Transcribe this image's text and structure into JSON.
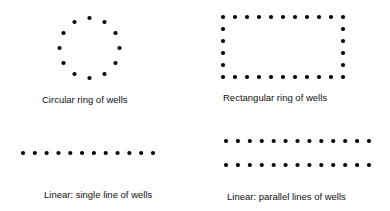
{
  "diagram": {
    "dot_color": "#000000",
    "dot_radius": 2.1,
    "panels": [
      {
        "id": "circular",
        "label": "Circular ring of wells",
        "shape": "circle",
        "well_count": 12,
        "center": [
          89.5,
          48
        ],
        "radius": 30,
        "label_pos": [
          42,
          95
        ]
      },
      {
        "id": "rectangular",
        "label": "Rectangular ring of wells",
        "shape": "rectangle",
        "wells_per_long_side": 11,
        "wells_per_short_side": 6,
        "well_count": 30,
        "x_range": [
          223,
          343
        ],
        "y_range": [
          17,
          77
        ],
        "label_pos": [
          223,
          93
        ]
      },
      {
        "id": "single-line",
        "label": "Linear: single line of wells",
        "shape": "line",
        "well_count": 12,
        "y": 153,
        "x_range": [
          23,
          153
        ],
        "label_pos": [
          44,
          190
        ]
      },
      {
        "id": "parallel-lines",
        "label": "Linear: parallel lines of wells",
        "shape": "parallel-lines",
        "wells_per_line": 13,
        "line_count": 2,
        "well_count": 26,
        "y_lines": [
          141,
          165
        ],
        "x_range": [
          226,
          369
        ],
        "label_pos": [
          227,
          192
        ]
      }
    ]
  }
}
